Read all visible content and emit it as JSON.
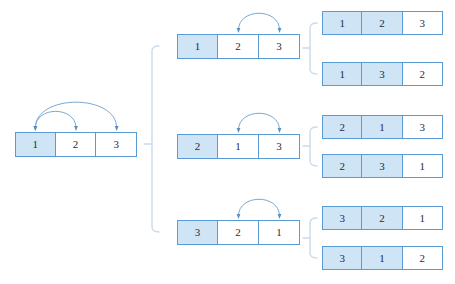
{
  "diagram": {
    "colors": {
      "cell_border": "#5b9bd5",
      "cell_fill_highlight": "#cfe5f5",
      "cell_fill_plain": "#ffffff",
      "arc_stroke": "#7ba9d2",
      "arrowhead": "#5b8fc0",
      "bracket": "#c9dced",
      "background": "#ffffff",
      "text": "#1f2b38"
    },
    "levels": [
      {
        "name": "root",
        "nodes": [
          {
            "id": "root",
            "cells": [
              {
                "value": "1",
                "highlight": true
              },
              {
                "value": "2",
                "highlight": false
              },
              {
                "value": "3",
                "highlight": false
              }
            ],
            "highlight_count": 0,
            "arcs": [
              {
                "from_index": 0,
                "to_index": 1
              },
              {
                "from_index": 0,
                "to_index": 2
              }
            ],
            "x": 15,
            "y": 132,
            "width": 122,
            "height": 25
          }
        ]
      },
      {
        "name": "level-1",
        "nodes": [
          {
            "id": "mid-1",
            "cells": [
              {
                "value": "1",
                "highlight": true
              },
              {
                "value": "2",
                "highlight": false
              },
              {
                "value": "3",
                "highlight": false
              }
            ],
            "arcs": [
              {
                "from_index": 1,
                "to_index": 2
              }
            ],
            "x": 177,
            "y": 34,
            "width": 123,
            "height": 25
          },
          {
            "id": "mid-2",
            "cells": [
              {
                "value": "2",
                "highlight": true
              },
              {
                "value": "1",
                "highlight": false
              },
              {
                "value": "3",
                "highlight": false
              }
            ],
            "arcs": [
              {
                "from_index": 1,
                "to_index": 2
              }
            ],
            "x": 177,
            "y": 134,
            "width": 123,
            "height": 25
          },
          {
            "id": "mid-3",
            "cells": [
              {
                "value": "3",
                "highlight": true
              },
              {
                "value": "2",
                "highlight": false
              },
              {
                "value": "1",
                "highlight": false
              }
            ],
            "arcs": [
              {
                "from_index": 1,
                "to_index": 2
              }
            ],
            "x": 177,
            "y": 220,
            "width": 123,
            "height": 25
          }
        ]
      },
      {
        "name": "level-2",
        "nodes": [
          {
            "id": "leaf-1",
            "cells": [
              {
                "value": "1",
                "highlight": true
              },
              {
                "value": "2",
                "highlight": true
              },
              {
                "value": "3",
                "highlight": false
              }
            ],
            "arcs": [],
            "x": 322,
            "y": 11,
            "width": 121,
            "height": 24
          },
          {
            "id": "leaf-2",
            "cells": [
              {
                "value": "1",
                "highlight": true
              },
              {
                "value": "3",
                "highlight": true
              },
              {
                "value": "2",
                "highlight": false
              }
            ],
            "arcs": [],
            "x": 322,
            "y": 62,
            "width": 121,
            "height": 24
          },
          {
            "id": "leaf-3",
            "cells": [
              {
                "value": "2",
                "highlight": true
              },
              {
                "value": "1",
                "highlight": true
              },
              {
                "value": "3",
                "highlight": false
              }
            ],
            "arcs": [],
            "x": 322,
            "y": 115,
            "width": 121,
            "height": 24
          },
          {
            "id": "leaf-4",
            "cells": [
              {
                "value": "2",
                "highlight": true
              },
              {
                "value": "3",
                "highlight": true
              },
              {
                "value": "1",
                "highlight": false
              }
            ],
            "arcs": [],
            "x": 322,
            "y": 154,
            "width": 121,
            "height": 24
          },
          {
            "id": "leaf-5",
            "cells": [
              {
                "value": "3",
                "highlight": true
              },
              {
                "value": "2",
                "highlight": true
              },
              {
                "value": "1",
                "highlight": false
              }
            ],
            "arcs": [],
            "x": 322,
            "y": 206,
            "width": 121,
            "height": 24
          },
          {
            "id": "leaf-6",
            "cells": [
              {
                "value": "3",
                "highlight": true
              },
              {
                "value": "1",
                "highlight": true
              },
              {
                "value": "2",
                "highlight": false
              }
            ],
            "arcs": [],
            "x": 322,
            "y": 246,
            "width": 121,
            "height": 24
          }
        ]
      }
    ],
    "brackets": [
      {
        "id": "bracket-root",
        "x": 152,
        "top": 46,
        "bottom": 232,
        "stub_x": 144,
        "stub_y": 144
      },
      {
        "id": "bracket-mid-1",
        "x": 310,
        "top": 23,
        "bottom": 74,
        "stub_x": 303,
        "stub_y": 48
      },
      {
        "id": "bracket-mid-2",
        "x": 310,
        "top": 127,
        "bottom": 166,
        "stub_x": 303,
        "stub_y": 146
      },
      {
        "id": "bracket-mid-3",
        "x": 310,
        "top": 218,
        "bottom": 258,
        "stub_x": 303,
        "stub_y": 238
      }
    ]
  }
}
